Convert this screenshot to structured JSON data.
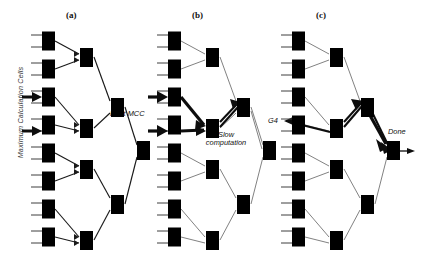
{
  "figure": {
    "axis_label": "Maximum Calculation Cells",
    "panels": [
      {
        "id": "a",
        "label": "(a)",
        "annotations": [
          {
            "name": "root-mcc",
            "text": "Root MCC"
          }
        ]
      },
      {
        "id": "b",
        "label": "(b)",
        "annotations": [
          {
            "name": "slow-computation-line1",
            "text": "Slow"
          },
          {
            "name": "slow-computation-line2",
            "text": "computation"
          }
        ]
      },
      {
        "id": "c",
        "label": "(c)",
        "annotations": [
          {
            "name": "g4",
            "text": "G4"
          },
          {
            "name": "done",
            "text": "Done"
          }
        ]
      }
    ],
    "tree": {
      "leaf_count": 8,
      "level2_count": 4,
      "level3_count": 2,
      "root_count": 1,
      "node_kind": "maximum-calculation-cell",
      "highlighted_leaves": [
        2,
        3
      ]
    },
    "colors": {
      "node_stroke": "#3f3f3f",
      "edge_light": "#6a6a6a",
      "edge_dark": "#1a1a1a",
      "highlight": "#0d0d0d",
      "background": "#ffffff"
    }
  }
}
